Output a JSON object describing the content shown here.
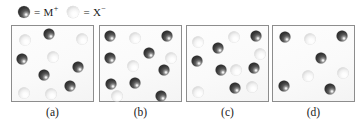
{
  "figure": {
    "type": "particulate-diagram",
    "background_color": "#ffffff",
    "box_border_color": "#8d8d8d",
    "box_fill_color": "#fafafa"
  },
  "legend": {
    "entries": [
      {
        "sphere": "dark-sphere",
        "equals": "=",
        "label": "M",
        "charge": "+",
        "color": "#3a3a3a"
      },
      {
        "sphere": "light-sphere",
        "equals": "=",
        "label": "X",
        "charge": "−",
        "color": "#e8e8e8"
      }
    ]
  },
  "panels": [
    {
      "id": "a",
      "caption": "(a)",
      "counts": {
        "cations": 5,
        "anions": 5,
        "total": 10
      },
      "spheres": [
        {
          "type": "light",
          "x": 14,
          "y": 15
        },
        {
          "type": "dark",
          "x": 38,
          "y": 9
        },
        {
          "type": "light",
          "x": 71,
          "y": 14
        },
        {
          "type": "dark",
          "x": 11,
          "y": 34
        },
        {
          "type": "light",
          "x": 42,
          "y": 32
        },
        {
          "type": "dark",
          "x": 67,
          "y": 42
        },
        {
          "type": "dark",
          "x": 33,
          "y": 50
        },
        {
          "type": "dark",
          "x": 59,
          "y": 61
        },
        {
          "type": "light",
          "x": 13,
          "y": 68
        },
        {
          "type": "light",
          "x": 40,
          "y": 69
        }
      ]
    },
    {
      "id": "b",
      "caption": "(b)",
      "counts": {
        "cations": 8,
        "anions": 4,
        "total": 12
      },
      "spheres": [
        {
          "type": "dark",
          "x": 11,
          "y": 11
        },
        {
          "type": "light",
          "x": 36,
          "y": 13
        },
        {
          "type": "dark",
          "x": 68,
          "y": 11
        },
        {
          "type": "dark",
          "x": 11,
          "y": 33
        },
        {
          "type": "dark",
          "x": 50,
          "y": 28
        },
        {
          "type": "light",
          "x": 34,
          "y": 41
        },
        {
          "type": "dark",
          "x": 65,
          "y": 45
        },
        {
          "type": "dark",
          "x": 12,
          "y": 59
        },
        {
          "type": "dark",
          "x": 36,
          "y": 58
        },
        {
          "type": "light",
          "x": 18,
          "y": 71
        },
        {
          "type": "dark",
          "x": 62,
          "y": 71
        },
        {
          "type": "light",
          "x": 72,
          "y": 33
        }
      ]
    },
    {
      "id": "c",
      "caption": "(c)",
      "counts": {
        "cations": 6,
        "anions": 6,
        "total": 12
      },
      "spheres": [
        {
          "type": "light",
          "x": 12,
          "y": 17
        },
        {
          "type": "dark",
          "x": 32,
          "y": 23
        },
        {
          "type": "light",
          "x": 48,
          "y": 12
        },
        {
          "type": "dark",
          "x": 70,
          "y": 11
        },
        {
          "type": "dark",
          "x": 11,
          "y": 36
        },
        {
          "type": "dark",
          "x": 35,
          "y": 45
        },
        {
          "type": "light",
          "x": 50,
          "y": 45
        },
        {
          "type": "dark",
          "x": 68,
          "y": 43
        },
        {
          "type": "light",
          "x": 12,
          "y": 67
        },
        {
          "type": "dark",
          "x": 49,
          "y": 63
        },
        {
          "type": "light",
          "x": 66,
          "y": 62
        },
        {
          "type": "light",
          "x": 74,
          "y": 29
        }
      ]
    },
    {
      "id": "d",
      "caption": "(d)",
      "counts": {
        "cations": 5,
        "anions": 3,
        "total": 8
      },
      "spheres": [
        {
          "type": "dark",
          "x": 13,
          "y": 12
        },
        {
          "type": "light",
          "x": 38,
          "y": 14
        },
        {
          "type": "dark",
          "x": 70,
          "y": 11
        },
        {
          "type": "dark",
          "x": 49,
          "y": 33
        },
        {
          "type": "light",
          "x": 36,
          "y": 51
        },
        {
          "type": "light",
          "x": 71,
          "y": 48
        },
        {
          "type": "dark",
          "x": 12,
          "y": 61
        },
        {
          "type": "dark",
          "x": 58,
          "y": 64
        }
      ]
    }
  ]
}
